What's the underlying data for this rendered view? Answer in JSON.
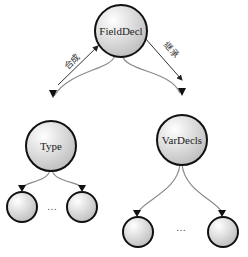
{
  "diagram": {
    "type": "tree",
    "nodes": [
      {
        "id": "fielddecl",
        "label": "FieldDecl"
      },
      {
        "id": "type",
        "label": "Type"
      },
      {
        "id": "vardecls",
        "label": "VarDecls"
      },
      {
        "id": "type-child-1",
        "label": ""
      },
      {
        "id": "type-child-2",
        "label": ""
      },
      {
        "id": "vardecls-child-1",
        "label": ""
      },
      {
        "id": "vardecls-child-2",
        "label": ""
      }
    ],
    "edge_labels": {
      "synthesize": "合成",
      "inherit": "继承"
    },
    "ellipsis": "…",
    "colors": {
      "stroke": "#111111",
      "node_fill_light": "#ffffff",
      "node_fill_dark": "#bdbdbd",
      "edge": "#888888",
      "arrow": "#222222"
    }
  }
}
